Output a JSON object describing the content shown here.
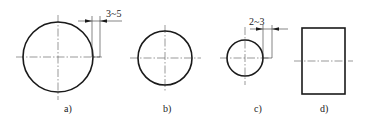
{
  "diagram": {
    "figures": [
      {
        "id": "a",
        "label": "a)",
        "shape": "circle",
        "dimension": "3~5"
      },
      {
        "id": "b",
        "label": "b)",
        "shape": "circle"
      },
      {
        "id": "c",
        "label": "c)",
        "shape": "circle",
        "dimension": "2~3"
      },
      {
        "id": "d",
        "label": "d)",
        "shape": "rectangle"
      }
    ],
    "colors": {
      "stroke": "#1a1a1a",
      "centerline": "#555555",
      "background": "#ffffff"
    }
  }
}
